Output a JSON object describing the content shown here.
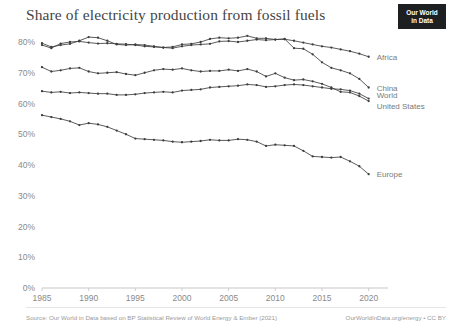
{
  "header": {
    "title": "Share of electricity production from fossil fuels",
    "logo_line1": "Our World",
    "logo_line2": "in Data"
  },
  "footer": {
    "source": "Source: Our World in Data based on BP Statistical Review of World Energy & Ember (2021)",
    "attribution": "OurWorldInData.org/energy • CC BY"
  },
  "chart_data": {
    "type": "line",
    "title": "Share of electricity production from fossil fuels",
    "xlabel": "",
    "ylabel": "",
    "xlim": [
      1985,
      2021
    ],
    "ylim": [
      0,
      85
    ],
    "grid": false,
    "legend_position": "right-inline",
    "x_ticks": [
      1985,
      1990,
      1995,
      2000,
      2005,
      2010,
      2015,
      2020
    ],
    "y_ticks": [
      0,
      10,
      20,
      30,
      40,
      50,
      60,
      70,
      80
    ],
    "y_tick_labels": [
      "0%",
      "10%",
      "20%",
      "30%",
      "40%",
      "50%",
      "60%",
      "70%",
      "80%"
    ],
    "x": [
      1985,
      1986,
      1987,
      1988,
      1989,
      1990,
      1991,
      1992,
      1993,
      1994,
      1995,
      1996,
      1997,
      1998,
      1999,
      2000,
      2001,
      2002,
      2003,
      2004,
      2005,
      2006,
      2007,
      2008,
      2009,
      2010,
      2011,
      2012,
      2013,
      2014,
      2015,
      2016,
      2017,
      2018,
      2019,
      2020
    ],
    "series": [
      {
        "name": "Africa",
        "color": "#3d3d3d",
        "values": [
          79.0,
          78.0,
          79.5,
          80.0,
          80.2,
          79.8,
          79.5,
          79.6,
          79.4,
          79.3,
          79.0,
          78.6,
          78.4,
          78.2,
          78.0,
          78.6,
          79.0,
          79.2,
          79.4,
          80.2,
          80.3,
          80.0,
          80.4,
          80.8,
          80.6,
          80.8,
          80.9,
          80.4,
          79.8,
          79.2,
          78.6,
          78.2,
          77.6,
          77.0,
          76.2,
          75.2
        ]
      },
      {
        "name": "China",
        "color": "#3d3d3d",
        "values": [
          79.6,
          78.4,
          79.0,
          79.4,
          80.4,
          81.6,
          81.4,
          80.4,
          79.2,
          79.0,
          79.2,
          79.0,
          78.6,
          78.2,
          78.4,
          79.2,
          79.4,
          80.0,
          81.0,
          81.4,
          81.2,
          81.4,
          82.0,
          81.2,
          81.2,
          80.8,
          81.0,
          78.0,
          77.8,
          76.0,
          73.4,
          71.6,
          70.8,
          69.8,
          68.0,
          65.2
        ]
      },
      {
        "name": "World",
        "color": "#3d3d3d",
        "values": [
          64.0,
          63.6,
          63.8,
          63.4,
          63.6,
          63.4,
          63.2,
          63.2,
          62.8,
          62.8,
          63.0,
          63.4,
          63.6,
          63.8,
          63.6,
          64.2,
          64.4,
          64.6,
          65.2,
          65.4,
          65.6,
          65.8,
          66.2,
          66.0,
          65.4,
          65.6,
          66.0,
          66.2,
          66.0,
          65.6,
          65.2,
          64.8,
          64.6,
          64.2,
          63.2,
          61.6
        ]
      },
      {
        "name": "United States",
        "color": "#3d3d3d",
        "values": [
          71.8,
          70.4,
          70.8,
          71.4,
          71.6,
          70.4,
          69.8,
          70.0,
          70.2,
          69.6,
          69.2,
          70.0,
          70.8,
          71.2,
          71.0,
          71.4,
          70.8,
          70.4,
          70.6,
          70.6,
          71.0,
          70.6,
          71.2,
          70.4,
          68.8,
          69.8,
          68.4,
          67.6,
          67.8,
          67.2,
          66.4,
          65.2,
          63.8,
          63.6,
          62.4,
          60.8
        ]
      },
      {
        "name": "Europe",
        "color": "#3d3d3d",
        "values": [
          56.2,
          55.6,
          55.0,
          54.2,
          53.0,
          53.6,
          53.2,
          52.4,
          51.2,
          50.0,
          48.6,
          48.4,
          48.2,
          48.0,
          47.6,
          47.4,
          47.6,
          47.8,
          48.2,
          48.0,
          48.0,
          48.4,
          48.2,
          47.6,
          46.2,
          46.6,
          46.4,
          46.2,
          44.6,
          42.8,
          42.6,
          42.4,
          42.6,
          41.2,
          39.6,
          37.0
        ]
      }
    ]
  }
}
